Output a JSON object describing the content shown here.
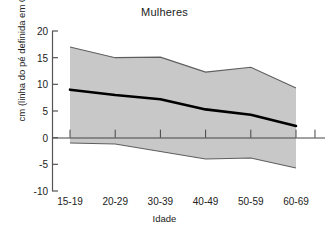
{
  "chart_data": {
    "type": "line",
    "title": "Mulheres",
    "xlabel": "Idade",
    "ylabel": "cm (linha do pé definida em 0)",
    "categories": [
      "15-19",
      "20-29",
      "30-39",
      "40-49",
      "50-59",
      "60-69"
    ],
    "ylim": [
      -10,
      20
    ],
    "yticks": [
      20,
      15,
      10,
      5,
      0,
      -5,
      -10
    ],
    "ytick_labels": [
      "20",
      "15",
      "10",
      "5",
      "0",
      "-5",
      "-10"
    ],
    "grid": false,
    "legend": null,
    "zero_reference_line": 0,
    "band_fill_color": "#c8c8c8",
    "band_edge_color": "#666666",
    "median_line_color": "#000000",
    "axis_color": "#555555",
    "series": [
      {
        "name": "Limite superior",
        "role": "upper",
        "values": [
          17.0,
          15.0,
          15.1,
          12.3,
          13.2,
          9.3
        ]
      },
      {
        "name": "Mediana",
        "role": "median",
        "values": [
          9.0,
          8.0,
          7.2,
          5.3,
          4.3,
          2.2
        ]
      },
      {
        "name": "Limite inferior",
        "role": "lower",
        "values": [
          -1.0,
          -1.2,
          -2.6,
          -4.0,
          -3.8,
          -5.7
        ]
      }
    ]
  }
}
